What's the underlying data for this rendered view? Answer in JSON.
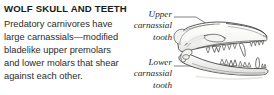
{
  "panel": {
    "title": "WOLF SKULL AND TEETH",
    "body_lines": [
      "Predatory carnivores have",
      "large carnassials—modified",
      "bladelike upper premolars",
      "and lower molars that shear",
      "against each other."
    ]
  },
  "callouts": {
    "upper": {
      "lines": [
        "Upper",
        "carnassial",
        "tooth"
      ]
    },
    "lower": {
      "lines": [
        "Lower",
        "carnassial",
        "tooth"
      ]
    }
  },
  "illustration": {
    "subject": "wolf-skull-lateral-profile",
    "orientation": "facing-right, jaws open"
  },
  "colors": {
    "background": "#ffffff",
    "title_text": "#1a1a1a",
    "body_text": "#2b2b2b",
    "callout_text": "#1f1f1f",
    "line_art_stroke": "#3a3a3a",
    "leader_line": "#4a4a4a",
    "bone_fill": "#fbfbfa",
    "shadow_fill": "#d8d8d6"
  }
}
